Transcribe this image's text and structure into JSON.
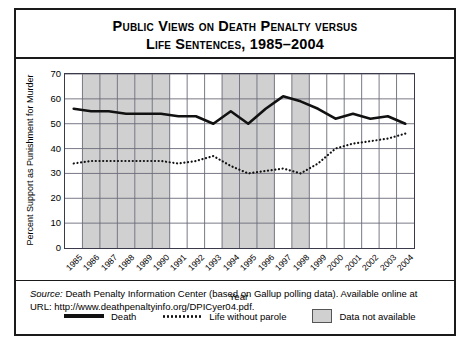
{
  "title": {
    "line1": "Public Views on Death Penalty versus",
    "line2": "Life Sentences, 1985–2004"
  },
  "axes": {
    "ylabel": "Percent Support as Punishment for Murder",
    "xlabel": "Year",
    "yticks": [
      "0",
      "10",
      "20",
      "30",
      "40",
      "50",
      "60",
      "70"
    ]
  },
  "legend": {
    "death": "Death",
    "life": "Life without parole",
    "unavailable": "Data not available"
  },
  "source": {
    "label": "Source:",
    "body": " Death Penalty Information Center (based on Gallup polling data). Available online at",
    "url_line": "URL: http://www.deathpenaltyinfo.org/DPICyer04.pdf."
  },
  "colors": {
    "death_line": "#111111",
    "life_line": "#111111",
    "shade": "#d0d0d0",
    "grid": "#6b6b7a",
    "frame": "#1a1a1a"
  },
  "chart_data": {
    "type": "line",
    "xlabel": "Year",
    "ylabel": "Percent Support as Punishment for Murder",
    "ylim": [
      0,
      70
    ],
    "ytick_step": 10,
    "grid": true,
    "legend_position": "below-axes",
    "categories": [
      1985,
      1986,
      1987,
      1988,
      1989,
      1990,
      1991,
      1992,
      1993,
      1994,
      1995,
      1996,
      1997,
      1998,
      1999,
      2000,
      2001,
      2002,
      2003,
      2004
    ],
    "series": [
      {
        "name": "Death",
        "style": "solid",
        "values": [
          56,
          55,
          55,
          54,
          54,
          54,
          53,
          53,
          50,
          55,
          50,
          56,
          61,
          59,
          56,
          52,
          54,
          52,
          53,
          50
        ]
      },
      {
        "name": "Life without parole",
        "style": "dotted",
        "values": [
          34,
          35,
          35,
          35,
          35,
          35,
          34,
          35,
          37,
          33,
          30,
          31,
          32,
          30,
          34,
          40,
          42,
          43,
          44,
          46
        ]
      }
    ],
    "shaded_years": [
      1986,
      1987,
      1988,
      1989,
      1990,
      1994,
      1995,
      1996,
      1998
    ],
    "shade_meaning": "Data not available"
  }
}
